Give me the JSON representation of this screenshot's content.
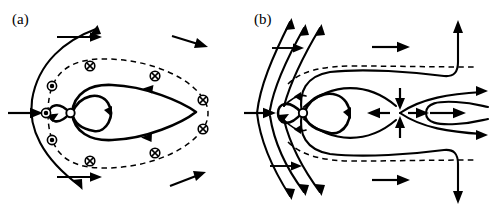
{
  "figure": {
    "background_color": "#ffffff",
    "ink_color": "#000000",
    "width": 489,
    "height": 212
  },
  "panels": [
    {
      "id": "a",
      "label": "(a)",
      "label_x": 12,
      "label_y": 22,
      "caption_text": "(a)",
      "description": "Closed magnetosphere, northward interplanetary magnetic field",
      "symbols": {
        "circle_dot_name": "circle-dot-symbol",
        "circle_dot_glyph": "⊙",
        "circle_dot_meaning": "field out of page",
        "circle_cross_name": "circle-cross-symbol",
        "circle_cross_glyph": "⊗",
        "circle_cross_meaning": "field into page",
        "circle_dot_count": 3,
        "circle_cross_count": 6
      },
      "free_stream_arrows": 2,
      "boundary_style": "dashed"
    },
    {
      "id": "b",
      "label": "(b)",
      "label_x": 10,
      "label_y": 22,
      "caption_text": "(b)",
      "description": "Open magnetosphere, southward interplanetary magnetic field with dayside reconnection and near-Earth neutral line",
      "x_point": {
        "name": "neutral-point",
        "x": 400,
        "y": 112,
        "inflow_arrows": 2,
        "outflow_arrows": 2
      },
      "free_stream_arrows": 2,
      "boundary_style": "dashed"
    }
  ]
}
